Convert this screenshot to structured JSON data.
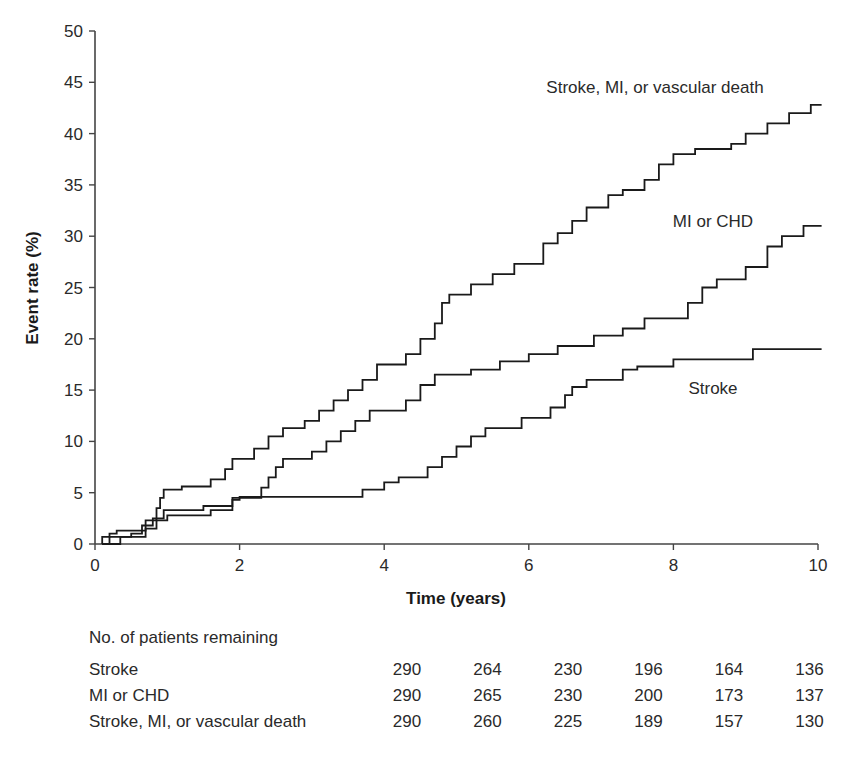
{
  "chart_data": {
    "type": "line",
    "subtype": "kaplan-meier-step",
    "title": "",
    "xlabel": "Time (years)",
    "ylabel": "Event rate (%)",
    "xlim": [
      0,
      10
    ],
    "ylim": [
      0,
      50
    ],
    "x_ticks": [
      0,
      2,
      4,
      6,
      8,
      10
    ],
    "y_ticks": [
      0,
      5,
      10,
      15,
      20,
      25,
      30,
      35,
      40,
      45,
      50
    ],
    "grid": false,
    "legend": "inline labels",
    "series": [
      {
        "name": "Stroke, MI, or vascular death",
        "label_pos": [
          655,
          87
        ],
        "points": [
          [
            0.1,
            0
          ],
          [
            0.1,
            0.7
          ],
          [
            0.2,
            0.7
          ],
          [
            0.2,
            1.0
          ],
          [
            0.3,
            1.0
          ],
          [
            0.3,
            1.3
          ],
          [
            0.7,
            1.3
          ],
          [
            0.7,
            2.3
          ],
          [
            0.85,
            2.3
          ],
          [
            0.85,
            3.5
          ],
          [
            0.9,
            3.5
          ],
          [
            0.9,
            4.5
          ],
          [
            0.95,
            4.5
          ],
          [
            0.95,
            5.3
          ],
          [
            1.2,
            5.3
          ],
          [
            1.2,
            5.6
          ],
          [
            1.6,
            5.6
          ],
          [
            1.6,
            6.3
          ],
          [
            1.8,
            6.3
          ],
          [
            1.8,
            7.3
          ],
          [
            1.9,
            7.3
          ],
          [
            1.9,
            8.3
          ],
          [
            2.2,
            8.3
          ],
          [
            2.2,
            9.3
          ],
          [
            2.4,
            9.3
          ],
          [
            2.4,
            10.5
          ],
          [
            2.6,
            10.5
          ],
          [
            2.6,
            11.3
          ],
          [
            2.9,
            11.3
          ],
          [
            2.9,
            12.0
          ],
          [
            3.1,
            12.0
          ],
          [
            3.1,
            13.0
          ],
          [
            3.3,
            13.0
          ],
          [
            3.3,
            14.0
          ],
          [
            3.5,
            14.0
          ],
          [
            3.5,
            15.0
          ],
          [
            3.7,
            15.0
          ],
          [
            3.7,
            16.0
          ],
          [
            3.9,
            16.0
          ],
          [
            3.9,
            17.5
          ],
          [
            4.3,
            17.5
          ],
          [
            4.3,
            18.5
          ],
          [
            4.5,
            18.5
          ],
          [
            4.5,
            20.0
          ],
          [
            4.7,
            20.0
          ],
          [
            4.7,
            21.5
          ],
          [
            4.8,
            21.5
          ],
          [
            4.8,
            23.5
          ],
          [
            4.9,
            23.5
          ],
          [
            4.9,
            24.3
          ],
          [
            5.2,
            24.3
          ],
          [
            5.2,
            25.3
          ],
          [
            5.5,
            25.3
          ],
          [
            5.5,
            26.3
          ],
          [
            5.8,
            26.3
          ],
          [
            5.8,
            27.3
          ],
          [
            6.2,
            27.3
          ],
          [
            6.2,
            29.3
          ],
          [
            6.4,
            29.3
          ],
          [
            6.4,
            30.3
          ],
          [
            6.6,
            30.3
          ],
          [
            6.6,
            31.5
          ],
          [
            6.8,
            31.5
          ],
          [
            6.8,
            32.8
          ],
          [
            7.1,
            32.8
          ],
          [
            7.1,
            34.0
          ],
          [
            7.3,
            34.0
          ],
          [
            7.3,
            34.5
          ],
          [
            7.6,
            34.5
          ],
          [
            7.6,
            35.5
          ],
          [
            7.8,
            35.5
          ],
          [
            7.8,
            37.0
          ],
          [
            8.0,
            37.0
          ],
          [
            8.0,
            38.0
          ],
          [
            8.3,
            38.0
          ],
          [
            8.3,
            38.5
          ],
          [
            8.8,
            38.5
          ],
          [
            8.8,
            39.0
          ],
          [
            9.0,
            39.0
          ],
          [
            9.0,
            40.0
          ],
          [
            9.3,
            40.0
          ],
          [
            9.3,
            41.0
          ],
          [
            9.6,
            41.0
          ],
          [
            9.6,
            42.0
          ],
          [
            9.9,
            42.0
          ],
          [
            9.9,
            42.8
          ],
          [
            10.05,
            42.8
          ]
        ]
      },
      {
        "name": "MI or CHD",
        "label_pos": [
          713,
          221
        ],
        "points": [
          [
            0.1,
            0
          ],
          [
            0.2,
            0
          ],
          [
            0.2,
            0.7
          ],
          [
            0.5,
            0.7
          ],
          [
            0.5,
            1.0
          ],
          [
            0.65,
            1.0
          ],
          [
            0.65,
            1.8
          ],
          [
            0.8,
            1.8
          ],
          [
            0.8,
            2.5
          ],
          [
            0.95,
            2.5
          ],
          [
            0.95,
            3.3
          ],
          [
            1.5,
            3.3
          ],
          [
            1.5,
            3.7
          ],
          [
            1.9,
            3.7
          ],
          [
            1.9,
            4.5
          ],
          [
            2.3,
            4.5
          ],
          [
            2.3,
            5.5
          ],
          [
            2.4,
            5.5
          ],
          [
            2.4,
            6.5
          ],
          [
            2.5,
            6.5
          ],
          [
            2.5,
            7.5
          ],
          [
            2.6,
            7.5
          ],
          [
            2.6,
            8.3
          ],
          [
            3.0,
            8.3
          ],
          [
            3.0,
            9.0
          ],
          [
            3.2,
            9.0
          ],
          [
            3.2,
            10.0
          ],
          [
            3.4,
            10.0
          ],
          [
            3.4,
            11.0
          ],
          [
            3.6,
            11.0
          ],
          [
            3.6,
            12.0
          ],
          [
            3.8,
            12.0
          ],
          [
            3.8,
            13.0
          ],
          [
            4.3,
            13.0
          ],
          [
            4.3,
            14.0
          ],
          [
            4.5,
            14.0
          ],
          [
            4.5,
            15.5
          ],
          [
            4.7,
            15.5
          ],
          [
            4.7,
            16.5
          ],
          [
            5.2,
            16.5
          ],
          [
            5.2,
            17.0
          ],
          [
            5.6,
            17.0
          ],
          [
            5.6,
            17.8
          ],
          [
            6.0,
            17.8
          ],
          [
            6.0,
            18.5
          ],
          [
            6.4,
            18.5
          ],
          [
            6.4,
            19.3
          ],
          [
            6.9,
            19.3
          ],
          [
            6.9,
            20.3
          ],
          [
            7.3,
            20.3
          ],
          [
            7.3,
            21.0
          ],
          [
            7.6,
            21.0
          ],
          [
            7.6,
            22.0
          ],
          [
            8.2,
            22.0
          ],
          [
            8.2,
            23.5
          ],
          [
            8.4,
            23.5
          ],
          [
            8.4,
            25.0
          ],
          [
            8.6,
            25.0
          ],
          [
            8.6,
            25.8
          ],
          [
            9.0,
            25.8
          ],
          [
            9.0,
            27.0
          ],
          [
            9.3,
            27.0
          ],
          [
            9.3,
            29.0
          ],
          [
            9.5,
            29.0
          ],
          [
            9.5,
            30.0
          ],
          [
            9.8,
            30.0
          ],
          [
            9.8,
            31.0
          ],
          [
            10.05,
            31.0
          ]
        ]
      },
      {
        "name": "Stroke",
        "label_pos": [
          713,
          388
        ],
        "points": [
          [
            0.1,
            0
          ],
          [
            0.35,
            0
          ],
          [
            0.35,
            0.7
          ],
          [
            0.7,
            0.7
          ],
          [
            0.7,
            1.5
          ],
          [
            0.85,
            1.5
          ],
          [
            0.85,
            2.3
          ],
          [
            1.0,
            2.3
          ],
          [
            1.0,
            2.8
          ],
          [
            1.6,
            2.8
          ],
          [
            1.6,
            3.3
          ],
          [
            1.9,
            3.3
          ],
          [
            1.9,
            4.3
          ],
          [
            2.0,
            4.3
          ],
          [
            2.0,
            4.6
          ],
          [
            3.7,
            4.6
          ],
          [
            3.7,
            5.3
          ],
          [
            4.0,
            5.3
          ],
          [
            4.0,
            6.0
          ],
          [
            4.2,
            6.0
          ],
          [
            4.2,
            6.5
          ],
          [
            4.6,
            6.5
          ],
          [
            4.6,
            7.5
          ],
          [
            4.8,
            7.5
          ],
          [
            4.8,
            8.5
          ],
          [
            5.0,
            8.5
          ],
          [
            5.0,
            9.5
          ],
          [
            5.2,
            9.5
          ],
          [
            5.2,
            10.5
          ],
          [
            5.4,
            10.5
          ],
          [
            5.4,
            11.3
          ],
          [
            5.9,
            11.3
          ],
          [
            5.9,
            12.3
          ],
          [
            6.3,
            12.3
          ],
          [
            6.3,
            13.3
          ],
          [
            6.5,
            13.3
          ],
          [
            6.5,
            14.5
          ],
          [
            6.6,
            14.5
          ],
          [
            6.6,
            15.3
          ],
          [
            6.8,
            15.3
          ],
          [
            6.8,
            16.0
          ],
          [
            7.3,
            16.0
          ],
          [
            7.3,
            17.0
          ],
          [
            7.5,
            17.0
          ],
          [
            7.5,
            17.3
          ],
          [
            8.0,
            17.3
          ],
          [
            8.0,
            18.0
          ],
          [
            9.1,
            18.0
          ],
          [
            9.1,
            19.0
          ],
          [
            10.05,
            19.0
          ]
        ]
      }
    ],
    "risk_table": {
      "title": "No. of patients remaining",
      "timepoints": [
        0,
        2,
        4,
        6,
        8,
        10
      ],
      "rows": [
        {
          "label": "Stroke",
          "values": [
            290,
            264,
            230,
            196,
            164,
            136
          ]
        },
        {
          "label": "MI or CHD",
          "values": [
            290,
            265,
            230,
            200,
            173,
            137
          ]
        },
        {
          "label": "Stroke, MI, or vascular death",
          "values": [
            290,
            260,
            225,
            189,
            157,
            130
          ]
        }
      ]
    }
  },
  "colors": {
    "line": "#1a1a1a",
    "axis": "#444444",
    "text": "#2a2a2a"
  }
}
